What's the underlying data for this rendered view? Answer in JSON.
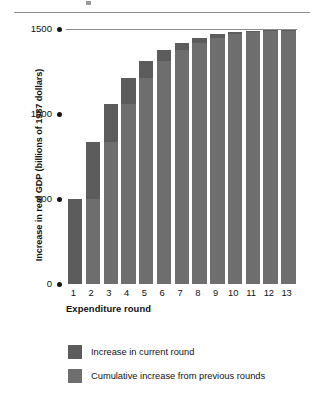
{
  "chart_data": {
    "type": "bar",
    "title": "",
    "subtitle": "",
    "xlabel": "Expenditure round",
    "ylabel": "Increase in real GDP (billions of 1987 dollars)",
    "categories": [
      "1",
      "2",
      "3",
      "4",
      "5",
      "6",
      "7",
      "8",
      "9",
      "10",
      "11",
      "12",
      "13"
    ],
    "series": [
      {
        "name": "Cumulative increase from previous rounds",
        "color": "#6e6e6e",
        "values": [
          0,
          500,
          835,
          1060,
          1210,
          1310,
          1375,
          1420,
          1450,
          1468,
          1480,
          1487,
          1492
        ]
      },
      {
        "name": "Increase in current round",
        "color": "#5c5c5c",
        "values": [
          500,
          335,
          225,
          150,
          100,
          65,
          45,
          30,
          18,
          12,
          7,
          5,
          3
        ]
      }
    ],
    "totals": [
      500,
      835,
      1060,
      1210,
      1310,
      1375,
      1420,
      1450,
      1468,
      1480,
      1487,
      1492,
      1495
    ],
    "stacked": true,
    "ylim": [
      0,
      1500
    ],
    "yticks": [
      0,
      500,
      1000,
      1500
    ],
    "ytick_labels": [
      "0",
      "500",
      "1000",
      "1500"
    ],
    "grid": "top-only",
    "legend_position": "bottom-left"
  },
  "axis": {
    "y_title": "Increase in real GDP (billions of 1987 dollars)",
    "x_title": "Expenditure round",
    "y_ticks": [
      {
        "label": "1500",
        "value": 1500
      },
      {
        "label": "1000",
        "value": 1000
      },
      {
        "label": "500",
        "value": 500
      },
      {
        "label": "0",
        "value": 0
      }
    ],
    "x_ticks": [
      "1",
      "2",
      "3",
      "4",
      "5",
      "6",
      "7",
      "8",
      "9",
      "10",
      "11",
      "12",
      "13"
    ]
  },
  "legend": {
    "items": [
      {
        "label": "Increase in current round",
        "color": "#5c5c5c"
      },
      {
        "label": "Cumulative increase from previous rounds",
        "color": "#6e6e6e"
      }
    ]
  },
  "colors": {
    "bar_current": "#5c5c5c",
    "bar_previous": "#6e6e6e",
    "rule": "#8d8d8d",
    "text": "#111111"
  }
}
